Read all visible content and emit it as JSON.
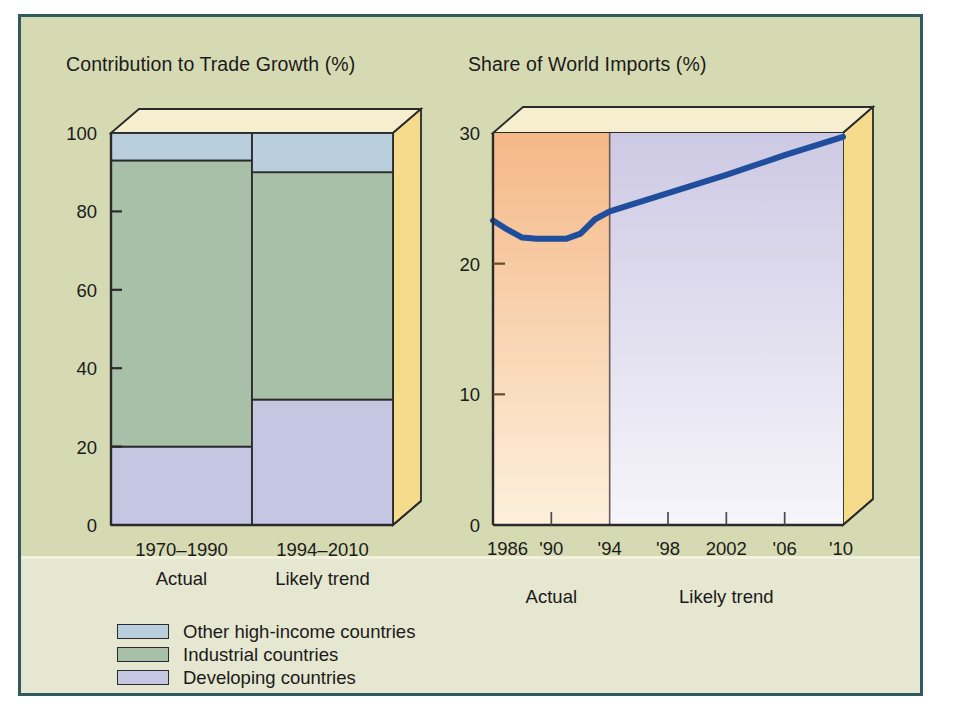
{
  "figure": {
    "background_color": "#d6dab3",
    "border_color": "#2f5a61",
    "lower_band_color": "#e6e7d0"
  },
  "legend": {
    "items": [
      {
        "label": "Other high-income countries",
        "color": "#b9cfdd"
      },
      {
        "label": "Industrial countries",
        "color": "#a8c0a8"
      },
      {
        "label": "Developing countries",
        "color": "#c4c6e2"
      }
    ]
  },
  "chart_data": [
    {
      "type": "bar",
      "id": "contribution-to-trade-growth",
      "title": "Contribution to Trade Growth (%)",
      "xlabel": "",
      "ylabel": "",
      "ylim": [
        0,
        100
      ],
      "yticks": [
        0,
        20,
        40,
        60,
        80,
        100
      ],
      "ytick_labels": [
        "0",
        "20",
        "40",
        "60",
        "80",
        "100"
      ],
      "grid": false,
      "stacked": true,
      "legend_position": "below-figure",
      "categories": [
        "1970–1990",
        "1994–2010"
      ],
      "category_sublabels": [
        "Actual",
        "Likely trend"
      ],
      "series": [
        {
          "name": "Developing countries",
          "color": "#c4c6e2",
          "values": [
            20,
            32
          ]
        },
        {
          "name": "Industrial countries",
          "color": "#a8c0a8",
          "values": [
            73,
            58
          ]
        },
        {
          "name": "Other high-income countries",
          "color": "#b9cfdd",
          "values": [
            7,
            10
          ]
        }
      ],
      "cumulative_tops": [
        [
          20,
          93,
          100
        ],
        [
          32,
          90,
          100
        ]
      ],
      "three_d": {
        "top_face_color": "#f5efd0",
        "side_face_color": "#f5dc8c",
        "depth_x": 28,
        "depth_y": 24
      }
    },
    {
      "type": "line",
      "id": "share-of-world-imports",
      "title": "Share of World Imports (%)",
      "xlabel": "",
      "ylabel": "",
      "ylim": [
        0,
        30
      ],
      "yticks": [
        0,
        10,
        20,
        30
      ],
      "ytick_labels": [
        "0",
        "10",
        "20",
        "30"
      ],
      "xlim": [
        1986,
        2010
      ],
      "xticks": [
        1986,
        1990,
        1994,
        1998,
        2002,
        2006,
        2010
      ],
      "xtick_labels": [
        "1986",
        "'90",
        "'94",
        "'98",
        "2002",
        "'06",
        "'10"
      ],
      "grid": false,
      "region_labels": [
        "Actual",
        "Likely trend"
      ],
      "region_split_year": 1994,
      "regions": [
        {
          "name": "Actual",
          "gradient_top": "#f5b887",
          "gradient_bottom": "#fdf0dc"
        },
        {
          "name": "Likely trend",
          "gradient_top": "#cdc9e4",
          "gradient_bottom": "#f6f5fa"
        }
      ],
      "line_color": "#1f4e9c",
      "line_width": 6,
      "x": [
        1986,
        1987,
        1988,
        1989,
        1990,
        1991,
        1992,
        1993,
        1994,
        1998,
        2002,
        2006,
        2010
      ],
      "values": [
        23.3,
        22.6,
        22.0,
        21.9,
        21.9,
        21.9,
        22.3,
        23.4,
        24.0,
        25.4,
        26.8,
        28.3,
        29.7
      ],
      "three_d": {
        "top_face_color": "#f5efd0",
        "side_face_color": "#f5dc8c",
        "depth_x": 30,
        "depth_y": 26
      }
    }
  ]
}
